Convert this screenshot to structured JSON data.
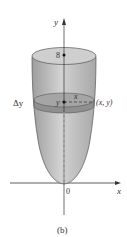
{
  "figure": {
    "caption": "(b)",
    "labels": {
      "y_axis": "y",
      "x_axis": "x",
      "origin": "0",
      "top_height": "8",
      "delta_y": "Δy",
      "slab_y": "y",
      "radius_x": "x",
      "point": "(x, y)"
    },
    "colors": {
      "solid_fill": "#b8b8b8",
      "top_fill": "#cfcfcf",
      "slab_fill": "#999999",
      "axis": "#333333"
    }
  }
}
